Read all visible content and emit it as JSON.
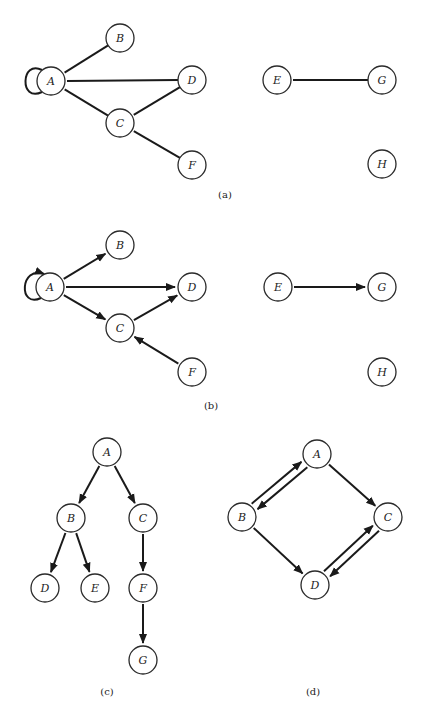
{
  "figure": {
    "node_radius": 14,
    "colors": {
      "stroke": "#1a1a1a",
      "fill": "#ffffff",
      "text": "#222222"
    }
  },
  "panels": [
    {
      "id": "a",
      "caption": "(a)",
      "caption_pos": [
        225,
        198
      ],
      "type": "undirected",
      "nodes": [
        {
          "id": "A",
          "label": "A",
          "x": 51,
          "y": 81
        },
        {
          "id": "B",
          "label": "B",
          "x": 120,
          "y": 38
        },
        {
          "id": "D",
          "label": "D",
          "x": 192,
          "y": 80
        },
        {
          "id": "C",
          "label": "C",
          "x": 120,
          "y": 123
        },
        {
          "id": "F",
          "label": "F",
          "x": 192,
          "y": 165
        },
        {
          "id": "E",
          "label": "E",
          "x": 277,
          "y": 80
        },
        {
          "id": "G",
          "label": "G",
          "x": 382,
          "y": 80
        },
        {
          "id": "H",
          "label": "H",
          "x": 382,
          "y": 164
        }
      ],
      "edges": [
        {
          "from": "A",
          "to": "A",
          "loop": true
        },
        {
          "from": "A",
          "to": "B"
        },
        {
          "from": "A",
          "to": "D"
        },
        {
          "from": "A",
          "to": "C"
        },
        {
          "from": "C",
          "to": "D"
        },
        {
          "from": "C",
          "to": "F"
        },
        {
          "from": "E",
          "to": "G"
        }
      ]
    },
    {
      "id": "b",
      "caption": "(b)",
      "caption_pos": [
        211,
        409
      ],
      "type": "directed",
      "nodes": [
        {
          "id": "A",
          "label": "A",
          "x": 50,
          "y": 287
        },
        {
          "id": "B",
          "label": "B",
          "x": 120,
          "y": 245
        },
        {
          "id": "D",
          "label": "D",
          "x": 192,
          "y": 287
        },
        {
          "id": "C",
          "label": "C",
          "x": 120,
          "y": 328
        },
        {
          "id": "F",
          "label": "F",
          "x": 192,
          "y": 372
        },
        {
          "id": "E",
          "label": "E",
          "x": 278,
          "y": 287
        },
        {
          "id": "G",
          "label": "G",
          "x": 382,
          "y": 287
        },
        {
          "id": "H",
          "label": "H",
          "x": 382,
          "y": 372
        }
      ],
      "edges": [
        {
          "from": "A",
          "to": "A",
          "loop": true
        },
        {
          "from": "A",
          "to": "B"
        },
        {
          "from": "A",
          "to": "D"
        },
        {
          "from": "A",
          "to": "C"
        },
        {
          "from": "C",
          "to": "D"
        },
        {
          "from": "F",
          "to": "C"
        },
        {
          "from": "E",
          "to": "G"
        }
      ]
    },
    {
      "id": "c",
      "caption": "(c)",
      "caption_pos": [
        107,
        695
      ],
      "type": "directed",
      "nodes": [
        {
          "id": "A",
          "label": "A",
          "x": 107,
          "y": 452
        },
        {
          "id": "B",
          "label": "B",
          "x": 71,
          "y": 518
        },
        {
          "id": "C",
          "label": "C",
          "x": 143,
          "y": 518
        },
        {
          "id": "D",
          "label": "D",
          "x": 45,
          "y": 588
        },
        {
          "id": "E",
          "label": "E",
          "x": 95,
          "y": 588
        },
        {
          "id": "F",
          "label": "F",
          "x": 143,
          "y": 588
        },
        {
          "id": "G",
          "label": "G",
          "x": 143,
          "y": 660
        }
      ],
      "edges": [
        {
          "from": "A",
          "to": "B"
        },
        {
          "from": "A",
          "to": "C"
        },
        {
          "from": "B",
          "to": "D"
        },
        {
          "from": "B",
          "to": "E"
        },
        {
          "from": "C",
          "to": "F"
        },
        {
          "from": "F",
          "to": "G"
        }
      ]
    },
    {
      "id": "d",
      "caption": "(d)",
      "caption_pos": [
        313,
        695
      ],
      "type": "directed",
      "nodes": [
        {
          "id": "A",
          "label": "A",
          "x": 317,
          "y": 454
        },
        {
          "id": "B",
          "label": "B",
          "x": 242,
          "y": 517
        },
        {
          "id": "C",
          "label": "C",
          "x": 388,
          "y": 517
        },
        {
          "id": "D",
          "label": "D",
          "x": 315,
          "y": 585
        }
      ],
      "edges": [
        {
          "from": "B",
          "to": "A",
          "offset": -4
        },
        {
          "from": "A",
          "to": "B",
          "offset": -4
        },
        {
          "from": "A",
          "to": "C"
        },
        {
          "from": "B",
          "to": "D"
        },
        {
          "from": "D",
          "to": "C",
          "offset": -4
        },
        {
          "from": "C",
          "to": "D",
          "offset": -4
        }
      ]
    }
  ]
}
